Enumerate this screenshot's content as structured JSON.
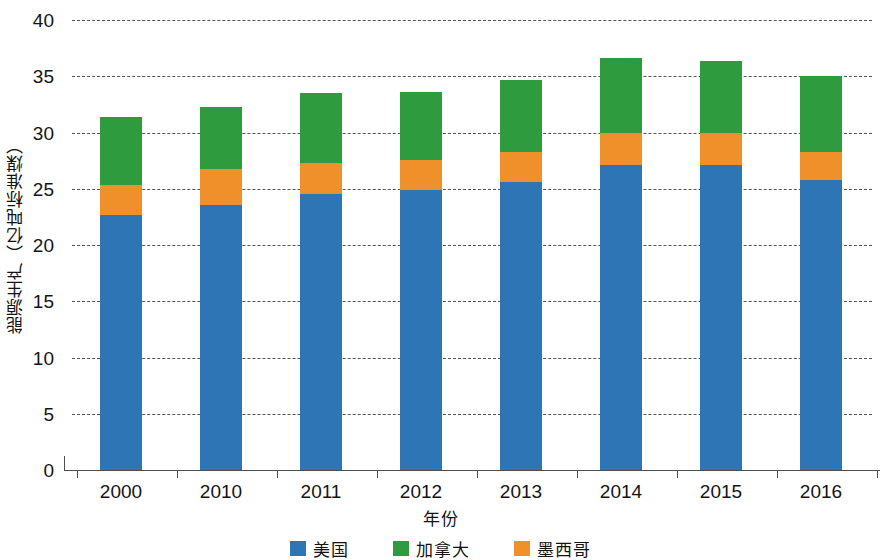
{
  "chart_data": {
    "type": "bar",
    "subtype": "stacked-bar",
    "title": "",
    "xlabel": "年份",
    "ylabel": "能源生产（亿吨标准煤）",
    "categories": [
      "2000",
      "2010",
      "2011",
      "2012",
      "2013",
      "2014",
      "2015",
      "2016"
    ],
    "series": [
      {
        "name": "美国",
        "color": "#2E75B6",
        "values": [
          22.7,
          23.6,
          24.5,
          24.9,
          25.6,
          27.1,
          27.1,
          25.8
        ]
      },
      {
        "name": "墨西哥",
        "color": "#F0902A",
        "values": [
          2.6,
          3.2,
          2.8,
          2.7,
          2.7,
          2.9,
          2.9,
          2.5
        ]
      },
      {
        "name": "加拿大",
        "color": "#2E9B3E",
        "values": [
          6.1,
          5.5,
          6.2,
          6.0,
          6.4,
          6.6,
          6.4,
          6.7
        ]
      }
    ],
    "stack_order": [
      "美国",
      "墨西哥",
      "加拿大"
    ],
    "totals": [
      31.4,
      32.3,
      33.5,
      33.6,
      34.7,
      36.6,
      36.4,
      35.0
    ],
    "ylim": [
      0,
      40
    ],
    "yticks": [
      0,
      5,
      10,
      15,
      20,
      25,
      30,
      35,
      40
    ],
    "ytick_labels": [
      "0",
      "5",
      "10",
      "15",
      "20",
      "25",
      "30",
      "35",
      "40"
    ],
    "grid": true,
    "grid_style": "dashed-horizontal",
    "legend_position": "bottom",
    "legend_order": [
      "美国",
      "加拿大",
      "墨西哥"
    ]
  },
  "axes": {
    "y_title": "能源生产（亿吨标准煤）",
    "x_title": "年份"
  },
  "legend": {
    "items": [
      {
        "label": "美国",
        "color": "#2E75B6"
      },
      {
        "label": "加拿大",
        "color": "#2E9B3E"
      },
      {
        "label": "墨西哥",
        "color": "#F0902A"
      }
    ]
  },
  "colors": {
    "usa_blue": "#2E75B6",
    "canada_green": "#2E9B3E",
    "mexico_orange": "#F0902A",
    "axis": "#4d4d4d",
    "grid": "#555555",
    "text": "#141414",
    "background": "#ffffff"
  }
}
